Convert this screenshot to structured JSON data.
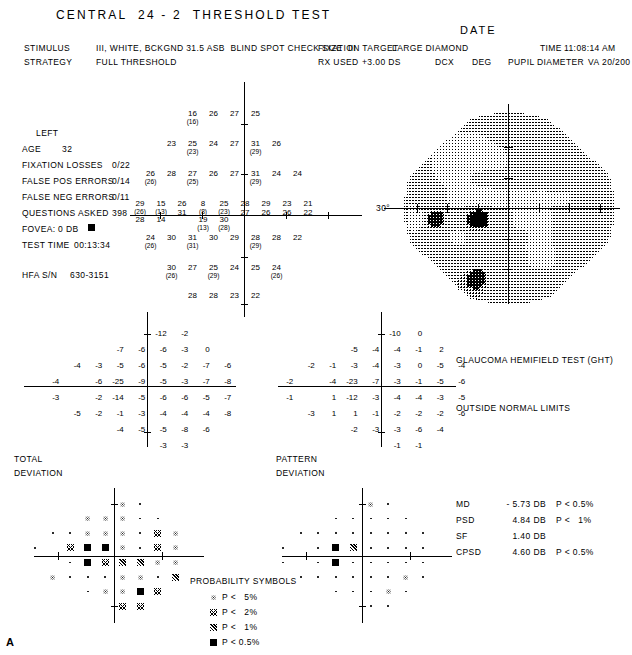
{
  "header": {
    "title": "CENTRAL  24 - 2  THRESHOLD TEST",
    "date_label": "DATE",
    "stimulus_label": "STIMULUS",
    "stimulus_value": "III, WHITE, BCKGND 31.5 ASB  BLIND SPOT CHECK SIZE  III",
    "strategy_label": "STRATEGY",
    "strategy_value": "FULL THRESHOLD",
    "fixation_target_label": "FIXATION TARGET",
    "fixation_target_value": "LARGE DIAMOND",
    "time_label": "TIME",
    "time_value": "11:08:14 AM",
    "rx_used_label": "RX USED",
    "rx_used_value": "+3.00 DS",
    "dcx_label": "DCX",
    "deg_label": "DEG",
    "pupil_diameter_label": "PUPIL DIAMETER",
    "va_label": "VA",
    "va_value": "20/200"
  },
  "patient": {
    "eye": "LEFT",
    "age_label": "AGE",
    "age_value": "32",
    "fixation_losses_label": "FIXATION LOSSES",
    "fixation_losses_value": "0/22",
    "false_pos_label": "FALSE POS ERRORS",
    "false_pos_value": "0/14",
    "false_neg_label": "FALSE NEG ERRORS",
    "false_neg_value": "0/11",
    "questions_label": "QUESTIONS ASKED",
    "questions_value": "398",
    "fovea_label": "FOVEA:",
    "fovea_value": "0 DB",
    "test_time_label": "TEST TIME",
    "test_time_value": "00:13:34",
    "serial_label": "HFA S/N",
    "serial_value": "630-3151"
  },
  "grayscale": {
    "degree_label": "30°"
  },
  "ght": {
    "title": "GLAUCOMA HEMIFIELD TEST (GHT)",
    "result": "OUTSIDE NORMAL LIMITS"
  },
  "indices": [
    {
      "name": "MD",
      "value": "- 5.73 DB",
      "p": "P < 0.5%"
    },
    {
      "name": "PSD",
      "value": "4.84 DB",
      "p": "P <   1%"
    },
    {
      "name": "SF",
      "value": "1.40 DB",
      "p": ""
    },
    {
      "name": "CPSD",
      "value": "4.60 DB",
      "p": "P < 0.5%"
    }
  ],
  "plots": {
    "total_deviation_label_l1": "TOTAL",
    "total_deviation_label_l2": "DEVIATION",
    "pattern_deviation_label_l1": "PATTERN",
    "pattern_deviation_label_l2": "DEVIATION"
  },
  "legend": {
    "title": "PROBABILITY SYMBOLS",
    "items": [
      {
        "symbol": "p5",
        "text": "P <   5%"
      },
      {
        "symbol": "p2",
        "text": "P <   2%"
      },
      {
        "symbol": "p1",
        "text": "P <   1%"
      },
      {
        "symbol": "p05",
        "text": "P < 0.5%"
      }
    ]
  },
  "figure_label": "A",
  "chart_data": {
    "type": "table",
    "threshold_grid": {
      "note": "Sensitivity in dB; value in parentheses is the retest value",
      "rows": [
        [
          null,
          null,
          {
            "v": "16",
            "r": "16"
          },
          {
            "v": "26"
          },
          {
            "v": "27"
          },
          {
            "v": "25"
          },
          null,
          null
        ],
        [
          null,
          {
            "v": "23"
          },
          {
            "v": "25",
            "r": "23"
          },
          {
            "v": "24"
          },
          {
            "v": "27"
          },
          {
            "v": "31",
            "r": "29"
          },
          {
            "v": "26"
          },
          null
        ],
        [
          {
            "v": "26",
            "r": "26"
          },
          {
            "v": "28"
          },
          {
            "v": "27",
            "r": "25"
          },
          {
            "v": "26"
          },
          {
            "v": "27"
          },
          {
            "v": "31",
            "r": "29"
          },
          {
            "v": "24"
          },
          {
            "v": "24"
          }
        ],
        [
          {
            "v": "29",
            "r": "26",
            "r2": "28"
          },
          {
            "v": "15",
            "r": "13",
            "r2": "14"
          },
          {
            "v": "26",
            "r2": "31"
          },
          {
            "v": "8",
            "r": "8",
            "r2": "19",
            "r3": "13"
          },
          {
            "v": "25",
            "r": "23",
            "r2": "30",
            "r3": "28"
          },
          {
            "v": "28",
            "r2": "27"
          },
          {
            "v": "29",
            "r2": "26"
          },
          {
            "v": "23",
            "r2": "26"
          },
          {
            "v": "21",
            "r2": "22"
          }
        ],
        [
          {
            "v": "24",
            "r": "26"
          },
          {
            "v": "30"
          },
          {
            "v": "31",
            "r": "31"
          },
          {
            "v": "30"
          },
          {
            "v": "29"
          },
          {
            "v": "28",
            "r": "29"
          },
          {
            "v": "28"
          },
          {
            "v": "22"
          }
        ],
        [
          null,
          {
            "v": "30",
            "r": "26"
          },
          {
            "v": "27"
          },
          {
            "v": "25",
            "r": "29"
          },
          {
            "v": "24"
          },
          {
            "v": "25"
          },
          {
            "v": "24",
            "r": "26"
          },
          null
        ],
        [
          null,
          null,
          {
            "v": "28"
          },
          {
            "v": "28"
          },
          {
            "v": "23"
          },
          {
            "v": "22"
          },
          null,
          null
        ]
      ]
    },
    "total_deviation": {
      "rows": [
        [
          null,
          null,
          -12,
          -2,
          -1,
          -3,
          null,
          null
        ],
        [
          null,
          -7,
          -6,
          -6,
          -3,
          0,
          -4,
          null
        ],
        [
          -4,
          -3,
          -5,
          -6,
          -5,
          -2,
          -7,
          -6
        ],
        [
          -4,
          null,
          -6,
          -25,
          -9,
          -5,
          -3,
          -7,
          -8
        ],
        [
          -3,
          null,
          -2,
          -14,
          -5,
          -6,
          -6,
          -5,
          -7
        ],
        [
          -5,
          -2,
          -1,
          -3,
          -4,
          -4,
          -4,
          -8
        ],
        [
          null,
          -4,
          -5,
          -5,
          -8,
          -6,
          -6,
          null
        ],
        [
          null,
          null,
          -3,
          -3,
          -7,
          -8,
          null,
          null
        ]
      ]
    },
    "pattern_deviation": {
      "rows": [
        [
          null,
          null,
          -10,
          0,
          1,
          -1,
          null,
          null
        ],
        [
          null,
          -5,
          -4,
          -4,
          -1,
          2,
          -2,
          null
        ],
        [
          -2,
          -1,
          -3,
          -4,
          -3,
          0,
          -5,
          -4
        ],
        [
          -2,
          null,
          -4,
          -23,
          -7,
          -3,
          -1,
          -5,
          -6
        ],
        [
          -1,
          null,
          1,
          -12,
          -3,
          -4,
          -4,
          -3,
          -5
        ],
        [
          -3,
          1,
          1,
          -1,
          -2,
          -2,
          -2,
          -6
        ],
        [
          null,
          -2,
          -3,
          -3,
          -6,
          -4,
          -4,
          null
        ],
        [
          null,
          null,
          -1,
          -1,
          -5,
          -6,
          null,
          null
        ]
      ]
    },
    "total_deviation_probability": {
      "legend": [
        "dot",
        "p5",
        "p2",
        "p1",
        "p05"
      ],
      "rows": [
        [
          null,
          null,
          "p5",
          "dot",
          "dot",
          "dot",
          null,
          null
        ],
        [
          null,
          "p5",
          "p5",
          "p5",
          "dot",
          "dot",
          "dot",
          null
        ],
        [
          "dot",
          "dot",
          "p5",
          "p5",
          "p5",
          "dot",
          "p2",
          "p5"
        ],
        [
          "dot",
          null,
          "p2",
          "p05",
          "p05",
          "p5",
          "dot",
          "p2",
          "p5"
        ],
        [
          null,
          null,
          "dot",
          "p05",
          "p2",
          "p1",
          "p1",
          "p5",
          "p5"
        ],
        [
          "p5",
          "dot",
          "dot",
          "dot",
          "p5",
          "p5",
          "dot",
          "p1"
        ],
        [
          null,
          "dot",
          "p5",
          "p5",
          "p05",
          "p2",
          "p5",
          null
        ],
        [
          null,
          null,
          "p2",
          "p2",
          "dot",
          "dot",
          null,
          null
        ]
      ]
    },
    "pattern_deviation_probability": {
      "rows": [
        [
          null,
          null,
          "p5",
          "dot",
          "dot",
          "dot",
          null,
          null
        ],
        [
          null,
          "dot",
          "dot",
          "dot",
          "dot",
          "dot",
          "dot",
          null
        ],
        [
          "dot",
          "dot",
          "dot",
          "dot",
          "dot",
          "dot",
          "dot",
          "dot"
        ],
        [
          "dot",
          null,
          "dot",
          "p05",
          "p1",
          "dot",
          "dot",
          "dot",
          "dot"
        ],
        [
          "dot",
          null,
          "dot",
          "p05",
          "dot",
          "dot",
          "dot",
          "dot",
          "dot"
        ],
        [
          "dot",
          "dot",
          "dot",
          "dot",
          "dot",
          "dot",
          "p5",
          "dot"
        ],
        [
          null,
          "dot",
          "dot",
          "dot",
          "p5",
          "dot",
          "dot",
          null
        ],
        [
          null,
          null,
          "dot",
          "dot",
          "dot",
          "dot",
          null,
          null
        ]
      ]
    }
  }
}
